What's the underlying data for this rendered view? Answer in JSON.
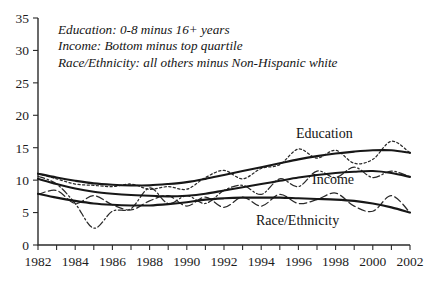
{
  "annotations": {
    "line1": "Education: 0-8 minus 16+ years",
    "line2": "Income: Bottom minus top quartile",
    "line3": "Race/Ethnicity: all others minus Non-Hispanic white"
  },
  "labels": {
    "education": "Education",
    "income": "Income",
    "race_ethnicity": "Race/Ethnicity"
  },
  "chart_data": {
    "type": "line",
    "title": "",
    "xlabel": "",
    "ylabel": "",
    "xlim": [
      1982,
      2002
    ],
    "ylim": [
      0,
      35
    ],
    "ytick_labels": [
      "0",
      "5",
      "10",
      "15",
      "20",
      "25",
      "30",
      "35"
    ],
    "yticks": [
      0,
      5,
      10,
      15,
      20,
      25,
      30,
      35
    ],
    "xtick_labels": [
      "1982",
      "1984",
      "1986",
      "1988",
      "1990",
      "1992",
      "1994",
      "1996",
      "1998",
      "2000",
      "2002"
    ],
    "xticks_major": [
      1982,
      1984,
      1986,
      1988,
      1990,
      1992,
      1994,
      1996,
      1998,
      2000,
      2002
    ],
    "xticks_all": [
      1982,
      1983,
      1984,
      1985,
      1986,
      1987,
      1988,
      1989,
      1990,
      1991,
      1992,
      1993,
      1994,
      1995,
      1996,
      1997,
      1998,
      1999,
      2000,
      2001,
      2002
    ],
    "grid": false,
    "legend_position": "inline-labels",
    "x": [
      1982,
      1983,
      1984,
      1985,
      1986,
      1987,
      1988,
      1989,
      1990,
      1991,
      1992,
      1993,
      1994,
      1995,
      1996,
      1997,
      1998,
      1999,
      2000,
      2001,
      2002
    ],
    "series": [
      {
        "name": "Education",
        "style": "dotted",
        "annotation": "Education: 0-8 minus 16+ years",
        "values": [
          11.0,
          10.2,
          9.4,
          9.2,
          9.0,
          9.4,
          8.6,
          9.0,
          8.6,
          10.4,
          11.5,
          10.2,
          11.8,
          12.4,
          14.8,
          13.4,
          14.6,
          12.6,
          13.2,
          16.0,
          14.2
        ],
        "smooth": [
          11.0,
          10.4,
          9.9,
          9.5,
          9.3,
          9.2,
          9.2,
          9.4,
          9.7,
          10.2,
          10.8,
          11.4,
          12.0,
          12.6,
          13.2,
          13.7,
          14.1,
          14.4,
          14.6,
          14.6,
          14.2
        ]
      },
      {
        "name": "Income",
        "style": "dash-dot",
        "annotation": "Income: Bottom minus top quartile",
        "values": [
          10.6,
          9.4,
          6.4,
          2.6,
          5.2,
          5.6,
          8.8,
          6.4,
          7.6,
          6.4,
          8.4,
          9.2,
          7.8,
          10.2,
          9.0,
          11.4,
          10.4,
          12.0,
          10.4,
          11.4,
          10.5
        ],
        "smooth": [
          10.2,
          9.4,
          8.7,
          8.2,
          7.9,
          7.7,
          7.6,
          7.5,
          7.6,
          7.9,
          8.4,
          8.9,
          9.4,
          9.9,
          10.4,
          10.8,
          11.1,
          11.3,
          11.4,
          11.1,
          10.5
        ]
      },
      {
        "name": "Race/Ethnicity",
        "style": "dashed",
        "annotation": "Race/Ethnicity: all others minus Non-Hispanic white",
        "values": [
          7.8,
          8.4,
          6.4,
          7.6,
          6.2,
          5.4,
          6.8,
          7.6,
          6.0,
          7.4,
          5.8,
          7.4,
          6.0,
          7.8,
          6.4,
          7.0,
          8.0,
          6.0,
          5.2,
          7.6,
          5.0
        ],
        "smooth": [
          7.9,
          7.3,
          6.8,
          6.4,
          6.2,
          6.1,
          6.1,
          6.3,
          6.6,
          7.0,
          7.2,
          7.3,
          7.3,
          7.3,
          7.2,
          7.1,
          7.0,
          6.8,
          6.4,
          5.8,
          5.0
        ]
      }
    ]
  }
}
